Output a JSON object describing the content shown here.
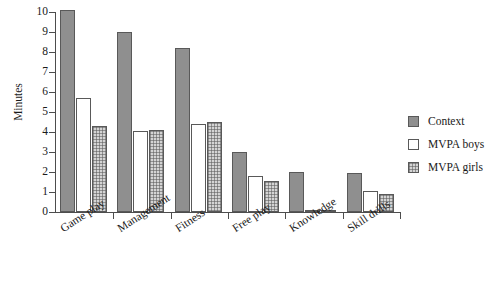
{
  "chart_data": {
    "type": "bar",
    "title": "",
    "subtitle": "",
    "xlabel": "",
    "ylabel": "Minutes",
    "ylim": [
      0,
      10
    ],
    "yticks": [
      0,
      1,
      2,
      3,
      4,
      5,
      6,
      7,
      8,
      9,
      10
    ],
    "grid": false,
    "legend_position": "right",
    "categories": [
      "Game play",
      "Management",
      "Fitness",
      "Free play",
      "Knowledge",
      "Skill drills"
    ],
    "series": [
      {
        "name": "Context",
        "values": [
          10.1,
          9.0,
          8.2,
          3.0,
          2.0,
          1.95
        ],
        "color": "#8f8f8f",
        "fill": "solid"
      },
      {
        "name": "MVPA boys",
        "values": [
          5.7,
          4.05,
          4.4,
          1.8,
          0.05,
          1.05
        ],
        "color": "#ffffff",
        "fill": "empty"
      },
      {
        "name": "MVPA girls",
        "values": [
          4.3,
          4.1,
          4.5,
          1.55,
          0.1,
          0.9
        ],
        "color": "#d4d4d4",
        "fill": "crosshatch"
      }
    ]
  },
  "axes": {
    "y_title": "Minutes",
    "y_tick_labels": [
      "10",
      "9",
      "8",
      "7",
      "6",
      "5",
      "4",
      "3",
      "2",
      "1",
      "0"
    ]
  },
  "legend": {
    "items": [
      {
        "label": "Context",
        "swatch": "solid-gray-swatch-icon"
      },
      {
        "label": "MVPA boys",
        "swatch": "empty-white-swatch-icon"
      },
      {
        "label": "MVPA girls",
        "swatch": "crosshatch-gray-swatch-icon"
      }
    ]
  }
}
